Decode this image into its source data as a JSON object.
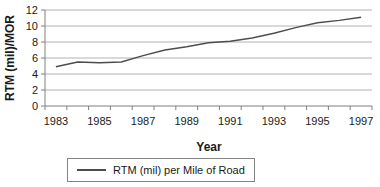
{
  "chart_data": {
    "type": "line",
    "title": "",
    "x": [
      1983,
      1984,
      1985,
      1986,
      1987,
      1988,
      1989,
      1990,
      1991,
      1992,
      1993,
      1994,
      1995,
      1996,
      1997
    ],
    "series": [
      {
        "name": "RTM (mil) per Mile of Road",
        "values": [
          4.9,
          5.5,
          5.4,
          5.5,
          6.3,
          7.0,
          7.4,
          7.9,
          8.1,
          8.5,
          9.1,
          9.8,
          10.4,
          10.7,
          11.1
        ]
      }
    ],
    "xlabel": "Year",
    "ylabel": "RTM (mil)/MOR",
    "ylim": [
      0,
      12
    ],
    "yticks": [
      0,
      2,
      4,
      6,
      8,
      10,
      12
    ],
    "xticks": [
      1983,
      1985,
      1987,
      1989,
      1991,
      1993,
      1995,
      1997
    ],
    "grid": "horizontal",
    "legend_position": "bottom",
    "colors": {
      "line": "#4d4d4d",
      "grid": "#b3b3b3",
      "axis": "#808080",
      "text": "#1a1a1a",
      "background": "#ffffff"
    }
  }
}
